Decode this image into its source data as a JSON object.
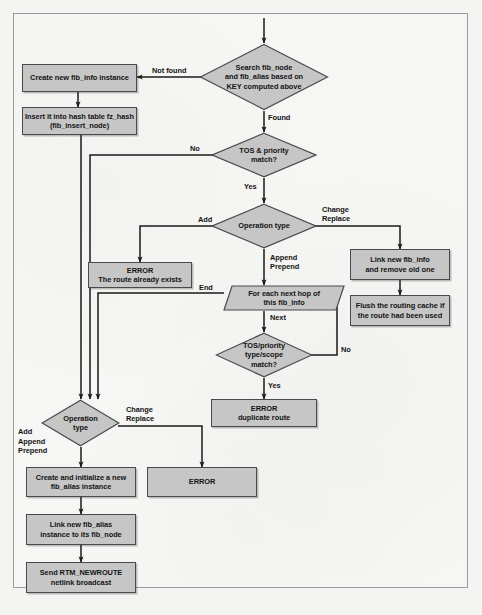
{
  "diagram": {
    "style": {
      "node_fill": "#c6c6c6",
      "node_stroke": "#4a4a4a",
      "line_color": "#1a1a1a",
      "page_background": "#f6f6f4",
      "border_color": "#9b9b9b"
    },
    "nodes": {
      "search": "Search fib_node\nand fib_alias based on\nKEY computed above",
      "create_fib_info": "Create new fib_info instance",
      "insert_hash": "Insert it into hash table fz_hash\n(fib_insert_node)",
      "tos_priority_match": "TOS & priority\nmatch?",
      "operation_type_1": "Operation type",
      "error_route_exists": "ERROR\nThe route already exists",
      "link_fib_info": "Link new fib_info\nand remove old one",
      "flush_cache": "Flush the routing cache if\nthe route had been used",
      "for_each_next_hop": "For each next hop of\nthis fib_info",
      "tos_type_scope_match": "TOS/priority\ntype/scope\nmatch?",
      "error_duplicate": "ERROR\nduplicate route",
      "operation_type_2": "Operation\ntype",
      "error_plain": "ERROR",
      "create_fib_alias": "Create and initialize a new\nfib_alias instance",
      "link_fib_alias": "Link new fib_alias\ninstance to its fib_node",
      "send_rtm": "Send RTM_NEWROUTE\nnetlink broadcast"
    },
    "edge_labels": {
      "not_found": "Not found",
      "found": "Found",
      "no_1": "No",
      "yes_1": "Yes",
      "add_1": "Add",
      "change_replace_1": "Change\nReplace",
      "append_prepend": "Append\nPrepend",
      "end": "End",
      "next": "Next",
      "no_2": "No",
      "yes_2": "Yes",
      "change_replace_2": "Change\nReplace",
      "add_append_prepend": "Add\nAppend\nPrepend"
    }
  }
}
